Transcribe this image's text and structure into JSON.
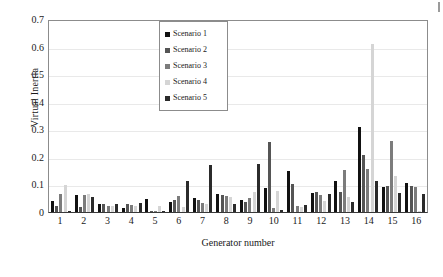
{
  "chart_data": {
    "type": "bar",
    "title": "",
    "xlabel": "Generator number",
    "ylabel": "Virtual Inertia",
    "ylim": [
      0,
      0.7
    ],
    "yticks": [
      "0",
      "0.1",
      "0.2",
      "0.3",
      "0.4",
      "0.5",
      "0.6",
      "0.7"
    ],
    "ytick_values": [
      0,
      0.1,
      0.2,
      0.3,
      0.4,
      0.5,
      0.6,
      0.7
    ],
    "grid": true,
    "legend_position": "upper-center",
    "categories": [
      "1",
      "2",
      "3",
      "4",
      "5",
      "6",
      "7",
      "8",
      "9",
      "10",
      "11",
      "12",
      "13",
      "14",
      "15",
      "16"
    ],
    "series": [
      {
        "name": "Scenario 1",
        "color": "#111111",
        "values": [
          0.04,
          0.062,
          0.03,
          0.013,
          0.049,
          0.038,
          0.052,
          0.067,
          0.044,
          0.087,
          0.147,
          0.07,
          0.112,
          0.307,
          0.09,
          0.105
        ]
      },
      {
        "name": "Scenario 2",
        "color": "#555555",
        "values": [
          0.022,
          0.017,
          0.028,
          0.03,
          0.0,
          0.044,
          0.042,
          0.06,
          0.036,
          0.253,
          0.1,
          0.071,
          0.072,
          0.205,
          0.096,
          0.095
        ]
      },
      {
        "name": "Scenario 3",
        "color": "#7c7c7c",
        "values": [
          0.066,
          0.062,
          0.023,
          0.026,
          0.0,
          0.059,
          0.033,
          0.057,
          0.052,
          0.016,
          0.021,
          0.062,
          0.152,
          0.157,
          0.256,
          0.09
        ]
      },
      {
        "name": "Scenario 4",
        "color": "#d5d5d5",
        "values": [
          0.098,
          0.066,
          0.021,
          0.021,
          0.023,
          0.019,
          0.028,
          0.053,
          0.071,
          0.077,
          0.019,
          0.039,
          0.055,
          0.61,
          0.129,
          0.005
        ]
      },
      {
        "name": "Scenario 5",
        "color": "#2b2b2b",
        "values": [
          0.002,
          0.053,
          0.028,
          0.031,
          0.001,
          0.112,
          0.17,
          0.028,
          0.174,
          0.006,
          0.025,
          0.067,
          0.036,
          0.111,
          0.07,
          0.066
        ]
      }
    ]
  },
  "legend": {
    "items": [
      {
        "label": "Scenario 1",
        "color": "#111111"
      },
      {
        "label": "Scenario 2",
        "color": "#555555"
      },
      {
        "label": "Scenario 3",
        "color": "#7c7c7c"
      },
      {
        "label": "Scenario 4",
        "color": "#d5d5d5"
      },
      {
        "label": "Scenario 5",
        "color": "#2b2b2b"
      }
    ]
  }
}
